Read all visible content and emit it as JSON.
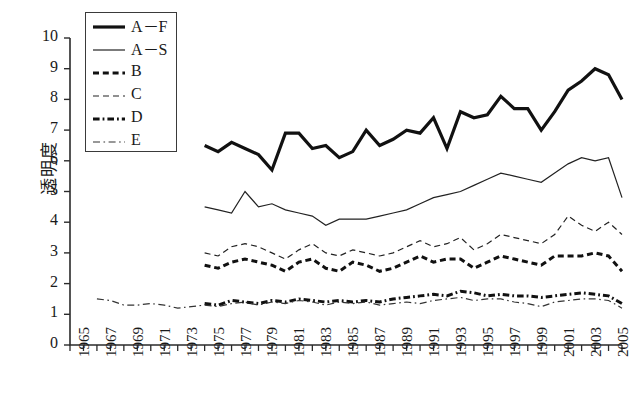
{
  "chart_data": {
    "type": "line",
    "title": "",
    "xlabel": "",
    "ylabel": "透明度",
    "ylim": [
      0,
      10
    ],
    "xlim": [
      1965,
      2006
    ],
    "ytick_labels": [
      "0",
      "1",
      "2",
      "3",
      "4",
      "5",
      "6",
      "7",
      "8",
      "9",
      "10"
    ],
    "xtick_labels": [
      "1965",
      "1967",
      "1969",
      "1971",
      "1973",
      "1975",
      "1977",
      "1979",
      "1981",
      "1983",
      "1985",
      "1987",
      "1989",
      "1991",
      "1993",
      "1995",
      "1997",
      "1999",
      "2001",
      "2003",
      "2005"
    ],
    "xtick_step": 2,
    "minor_tick_step": 1,
    "grid": false,
    "legend_position": "top-left",
    "series": [
      {
        "name": "A－F",
        "style": "solid",
        "width": 3.2,
        "color": "#111111",
        "x": [
          1975,
          1976,
          1977,
          1978,
          1979,
          1980,
          1981,
          1982,
          1983,
          1984,
          1985,
          1986,
          1987,
          1988,
          1989,
          1990,
          1991,
          1992,
          1993,
          1994,
          1995,
          1996,
          1997,
          1998,
          1999,
          2000,
          2001,
          2002,
          2003,
          2004,
          2005,
          2006
        ],
        "values": [
          6.5,
          6.3,
          6.6,
          6.4,
          6.2,
          5.7,
          6.9,
          6.9,
          6.4,
          6.5,
          6.1,
          6.3,
          7.0,
          6.5,
          6.7,
          7.0,
          6.9,
          7.4,
          6.4,
          7.6,
          7.4,
          7.5,
          8.1,
          7.7,
          7.7,
          7.0,
          7.6,
          8.3,
          8.6,
          9.0,
          8.8,
          8.0
        ]
      },
      {
        "name": "A－S",
        "style": "solid",
        "width": 1.2,
        "color": "#222222",
        "x": [
          1975,
          1976,
          1977,
          1978,
          1979,
          1980,
          1981,
          1982,
          1983,
          1984,
          1985,
          1986,
          1987,
          1988,
          1989,
          1990,
          1991,
          1992,
          1993,
          1994,
          1995,
          1996,
          1997,
          1998,
          1999,
          2000,
          2001,
          2002,
          2003,
          2004,
          2005,
          2006
        ],
        "values": [
          4.5,
          4.4,
          4.3,
          5.0,
          4.5,
          4.6,
          4.4,
          4.3,
          4.2,
          3.9,
          4.1,
          4.1,
          4.1,
          4.2,
          4.3,
          4.4,
          4.6,
          4.8,
          4.9,
          5.0,
          5.2,
          5.4,
          5.6,
          5.5,
          5.4,
          5.3,
          5.6,
          5.9,
          6.1,
          6.0,
          6.1,
          4.8
        ]
      },
      {
        "name": "B",
        "style": "dashed",
        "width": 3.0,
        "color": "#111111",
        "x": [
          1975,
          1976,
          1977,
          1978,
          1979,
          1980,
          1981,
          1982,
          1983,
          1984,
          1985,
          1986,
          1987,
          1988,
          1989,
          1990,
          1991,
          1992,
          1993,
          1994,
          1995,
          1996,
          1997,
          1998,
          1999,
          2000,
          2001,
          2002,
          2003,
          2004,
          2005,
          2006
        ],
        "values": [
          2.6,
          2.5,
          2.7,
          2.8,
          2.7,
          2.6,
          2.4,
          2.7,
          2.8,
          2.5,
          2.4,
          2.7,
          2.6,
          2.4,
          2.5,
          2.7,
          2.9,
          2.7,
          2.8,
          2.8,
          2.5,
          2.7,
          2.9,
          2.8,
          2.7,
          2.6,
          2.9,
          2.9,
          2.9,
          3.0,
          2.9,
          2.4
        ]
      },
      {
        "name": "C",
        "style": "dashed-thin",
        "width": 1.2,
        "color": "#222222",
        "x": [
          1975,
          1976,
          1977,
          1978,
          1979,
          1980,
          1981,
          1982,
          1983,
          1984,
          1985,
          1986,
          1987,
          1988,
          1989,
          1990,
          1991,
          1992,
          1993,
          1994,
          1995,
          1996,
          1997,
          1998,
          1999,
          2000,
          2001,
          2002,
          2003,
          2004,
          2005,
          2006
        ],
        "values": [
          3.0,
          2.9,
          3.2,
          3.3,
          3.2,
          3.0,
          2.8,
          3.1,
          3.3,
          3.0,
          2.9,
          3.1,
          3.0,
          2.9,
          3.0,
          3.2,
          3.4,
          3.2,
          3.3,
          3.5,
          3.1,
          3.3,
          3.6,
          3.5,
          3.4,
          3.3,
          3.6,
          4.2,
          3.9,
          3.7,
          4.0,
          3.6
        ]
      },
      {
        "name": "D",
        "style": "dash-dot",
        "width": 3.0,
        "color": "#111111",
        "x": [
          1975,
          1976,
          1977,
          1978,
          1979,
          1980,
          1981,
          1982,
          1983,
          1984,
          1985,
          1986,
          1987,
          1988,
          1989,
          1990,
          1991,
          1992,
          1993,
          1994,
          1995,
          1996,
          1997,
          1998,
          1999,
          2000,
          2001,
          2002,
          2003,
          2004,
          2005,
          2006
        ],
        "values": [
          1.35,
          1.3,
          1.45,
          1.4,
          1.35,
          1.45,
          1.4,
          1.5,
          1.45,
          1.4,
          1.45,
          1.4,
          1.45,
          1.4,
          1.5,
          1.55,
          1.6,
          1.65,
          1.6,
          1.75,
          1.7,
          1.6,
          1.65,
          1.6,
          1.6,
          1.55,
          1.6,
          1.65,
          1.7,
          1.65,
          1.6,
          1.35
        ]
      },
      {
        "name": "E",
        "style": "dash-dot-thin",
        "width": 1.2,
        "color": "#333333",
        "x": [
          1967,
          1968,
          1969,
          1970,
          1971,
          1972,
          1973,
          1974,
          1975,
          1976,
          1977,
          1978,
          1979,
          1980,
          1981,
          1982,
          1983,
          1984,
          1985,
          1986,
          1987,
          1988,
          1989,
          1990,
          1991,
          1992,
          1993,
          1994,
          1995,
          1996,
          1997,
          1998,
          1999,
          2000,
          2001,
          2002,
          2003,
          2004,
          2005,
          2006
        ],
        "values": [
          1.5,
          1.45,
          1.3,
          1.3,
          1.35,
          1.3,
          1.2,
          1.25,
          1.3,
          1.25,
          1.35,
          1.4,
          1.3,
          1.4,
          1.35,
          1.45,
          1.4,
          1.3,
          1.4,
          1.35,
          1.4,
          1.3,
          1.35,
          1.4,
          1.35,
          1.45,
          1.5,
          1.55,
          1.45,
          1.5,
          1.5,
          1.4,
          1.35,
          1.25,
          1.4,
          1.45,
          1.5,
          1.5,
          1.45,
          1.2
        ]
      }
    ]
  },
  "legend": {
    "entries": [
      {
        "label": "A－F"
      },
      {
        "label": "A－S"
      },
      {
        "label": "B"
      },
      {
        "label": "C"
      },
      {
        "label": "D"
      },
      {
        "label": "E"
      }
    ]
  },
  "axes": {
    "axis_color": "#2b2b2b"
  }
}
